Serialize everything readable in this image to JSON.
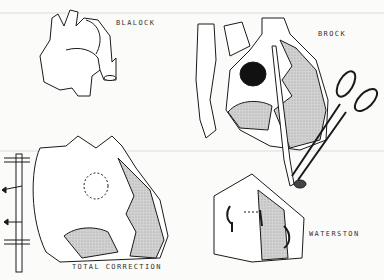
{
  "figure": {
    "panels": [
      {
        "id": "blalock",
        "label": "BLALOCK"
      },
      {
        "id": "brock",
        "label": "BROCK"
      },
      {
        "id": "total-correction",
        "label": "TOTAL CORRECTION"
      },
      {
        "id": "waterston",
        "label": "WATERSTON"
      }
    ]
  },
  "colors": {
    "line": "#1a1a1a",
    "shade": "#c9c9c9",
    "fill": "#ffffff",
    "background": "#fbfbfa"
  }
}
